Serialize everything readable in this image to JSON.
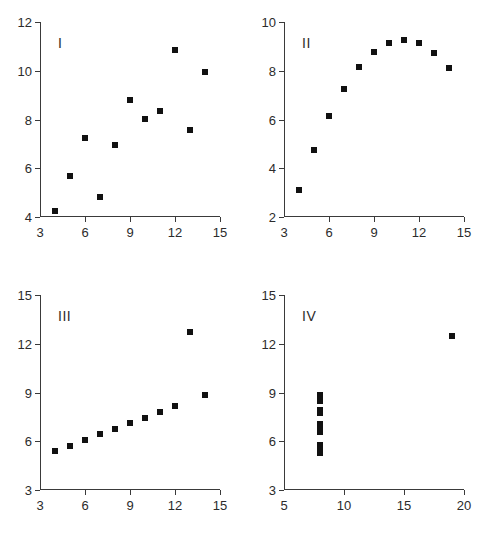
{
  "figure": {
    "title": "",
    "panel_labels": [
      "I",
      "II",
      "III",
      "IV"
    ]
  },
  "chart_data": [
    {
      "type": "scatter",
      "title": "I",
      "xlabel": "",
      "ylabel": "",
      "xlim": [
        3,
        15
      ],
      "ylim": [
        4,
        12
      ],
      "xticks": [
        3,
        6,
        9,
        12,
        15
      ],
      "yticks": [
        4,
        6,
        8,
        10,
        12
      ],
      "xtick_labels": [
        "3",
        "6",
        "9",
        "12",
        "15"
      ],
      "ytick_labels": [
        "4",
        "6",
        "8",
        "10",
        "12"
      ],
      "grid": false,
      "legend": "none",
      "marker": "filled-square",
      "marker_color": "#111111",
      "x": [
        10,
        8,
        13,
        9,
        11,
        14,
        6,
        4,
        12,
        7,
        5
      ],
      "y": [
        8.04,
        6.95,
        7.58,
        8.81,
        8.33,
        9.96,
        7.24,
        4.26,
        10.84,
        4.82,
        5.68
      ]
    },
    {
      "type": "scatter",
      "title": "II",
      "xlabel": "",
      "ylabel": "",
      "xlim": [
        3,
        15
      ],
      "ylim": [
        2,
        10
      ],
      "xticks": [
        3,
        6,
        9,
        12,
        15
      ],
      "yticks": [
        2,
        4,
        6,
        8,
        10
      ],
      "xtick_labels": [
        "3",
        "6",
        "9",
        "12",
        "15"
      ],
      "ytick_labels": [
        "2",
        "4",
        "6",
        "8",
        "10"
      ],
      "grid": false,
      "legend": "none",
      "marker": "filled-square",
      "marker_color": "#111111",
      "x": [
        10,
        8,
        13,
        9,
        11,
        14,
        6,
        4,
        12,
        7,
        5
      ],
      "y": [
        9.14,
        8.14,
        8.74,
        8.77,
        9.26,
        8.1,
        6.13,
        3.1,
        9.13,
        7.26,
        4.74
      ]
    },
    {
      "type": "scatter",
      "title": "III",
      "xlabel": "",
      "ylabel": "",
      "xlim": [
        3,
        15
      ],
      "ylim": [
        3,
        15
      ],
      "xticks": [
        3,
        6,
        9,
        12,
        15
      ],
      "yticks": [
        3,
        6,
        9,
        12,
        15
      ],
      "xtick_labels": [
        "3",
        "6",
        "9",
        "12",
        "15"
      ],
      "ytick_labels": [
        "3",
        "6",
        "9",
        "12",
        "15"
      ],
      "grid": false,
      "legend": "none",
      "marker": "filled-square",
      "marker_color": "#111111",
      "x": [
        10,
        8,
        13,
        9,
        11,
        14,
        6,
        4,
        12,
        7,
        5
      ],
      "y": [
        7.46,
        6.77,
        12.74,
        7.11,
        7.81,
        8.84,
        6.08,
        5.39,
        8.15,
        6.42,
        5.73
      ]
    },
    {
      "type": "scatter",
      "title": "IV",
      "xlabel": "",
      "ylabel": "",
      "xlim": [
        5,
        20
      ],
      "ylim": [
        3,
        15
      ],
      "xticks": [
        5,
        10,
        15,
        20
      ],
      "yticks": [
        3,
        6,
        9,
        12,
        15
      ],
      "xtick_labels": [
        "5",
        "10",
        "15",
        "20"
      ],
      "ytick_labels": [
        "3",
        "6",
        "9",
        "12",
        "15"
      ],
      "grid": false,
      "legend": "none",
      "marker": "filled-square",
      "marker_color": "#111111",
      "x": [
        8,
        8,
        8,
        8,
        8,
        8,
        8,
        19,
        8,
        8,
        8
      ],
      "y": [
        6.58,
        5.76,
        7.71,
        8.84,
        8.47,
        7.04,
        5.25,
        12.5,
        5.56,
        7.91,
        6.89
      ]
    }
  ]
}
